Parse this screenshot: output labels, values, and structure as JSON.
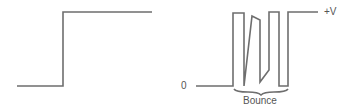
{
  "diagram": {
    "ideal_step": {
      "description": "ideal switch signal step",
      "points": [
        [
          17,
          86
        ],
        [
          63,
          86
        ],
        [
          63,
          12
        ],
        [
          152,
          12
        ]
      ]
    },
    "bounce_signal": {
      "description": "switch contact bounce signal",
      "points": [
        [
          196,
          86
        ],
        [
          233,
          86
        ],
        [
          233,
          13
        ],
        [
          244,
          13
        ],
        [
          244,
          86
        ],
        [
          253,
          15
        ],
        [
          260,
          20
        ],
        [
          260,
          82
        ],
        [
          266,
          72
        ],
        [
          269,
          60
        ],
        [
          269,
          12
        ],
        [
          279,
          12
        ],
        [
          279,
          86
        ],
        [
          288,
          86
        ],
        [
          288,
          12
        ],
        [
          320,
          12
        ]
      ],
      "low_label": "0",
      "high_label": "+V",
      "brace_label": "Bounce"
    },
    "line_color": "#6e6e6e"
  }
}
